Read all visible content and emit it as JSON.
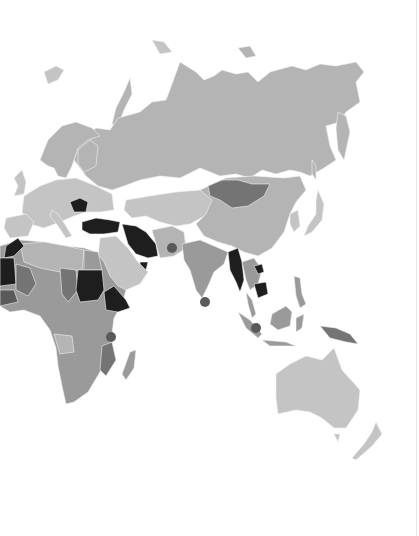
{
  "map": {
    "type": "choropleth",
    "palette": {
      "background": "#ffffff",
      "base": "#b4b4b4",
      "light": "#c4c4c4",
      "mid": "#9a9a9a",
      "dark": "#747474",
      "darkest": "#1e1e1e",
      "marker": "#5a5a5a",
      "border": "#f2f2f2"
    },
    "regions": [
      {
        "name": "Russia",
        "shade": "base"
      },
      {
        "name": "Scandinavia",
        "shade": "base"
      },
      {
        "name": "Europe",
        "shade": "light"
      },
      {
        "name": "Romania",
        "shade": "darkest"
      },
      {
        "name": "Turkey",
        "shade": "darkest"
      },
      {
        "name": "Iran",
        "shade": "darkest"
      },
      {
        "name": "UAE",
        "shade": "darkest"
      },
      {
        "name": "Morocco",
        "shade": "darkest"
      },
      {
        "name": "Mauritania",
        "shade": "darkest"
      },
      {
        "name": "Sudan",
        "shade": "darkest"
      },
      {
        "name": "Ethiopia",
        "shade": "darkest"
      },
      {
        "name": "Myanmar",
        "shade": "darkest"
      },
      {
        "name": "Cambodia",
        "shade": "darkest"
      },
      {
        "name": "Mongolia",
        "shade": "dark"
      },
      {
        "name": "Chad",
        "shade": "dark"
      },
      {
        "name": "Mali",
        "shade": "dark"
      },
      {
        "name": "Mozambique",
        "shade": "dark"
      },
      {
        "name": "China",
        "shade": "base"
      },
      {
        "name": "India",
        "shade": "mid"
      },
      {
        "name": "Arabia",
        "shade": "light"
      },
      {
        "name": "Africa",
        "shade": "mid"
      },
      {
        "name": "Indonesia",
        "shade": "mid"
      },
      {
        "name": "Papua New Guinea",
        "shade": "dark"
      },
      {
        "name": "Australia",
        "shade": "light"
      },
      {
        "name": "New Zealand",
        "shade": "light"
      },
      {
        "name": "Japan",
        "shade": "light"
      },
      {
        "name": "Madagascar",
        "shade": "mid"
      }
    ],
    "markers": [
      {
        "name": "Pakistan-marker",
        "x": 172,
        "y": 248,
        "r": 5
      },
      {
        "name": "Sri-Lanka-marker",
        "x": 205,
        "y": 302,
        "r": 5
      },
      {
        "name": "Singapore-marker",
        "x": 256,
        "y": 328,
        "r": 5
      },
      {
        "name": "Tanzania-marker",
        "x": 111,
        "y": 337,
        "r": 5
      }
    ]
  }
}
